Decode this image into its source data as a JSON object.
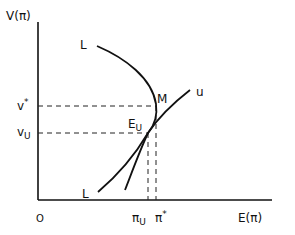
{
  "diagram": {
    "y_axis_label": "V(π)",
    "x_axis_label": "E(π)",
    "origin_label": "O",
    "y_ticks": [
      {
        "label": "v*",
        "main": "v",
        "sup": "*"
      },
      {
        "label": "vU",
        "main": "v",
        "sub": "U"
      }
    ],
    "x_ticks": [
      {
        "label": "πU",
        "main": "π",
        "sub": "U"
      },
      {
        "label": "π*",
        "main": "π",
        "sup": "*"
      }
    ],
    "curve_labels": {
      "L_upper": "L",
      "L_lower": "L",
      "u": "u"
    },
    "points": {
      "M": "M",
      "EU": {
        "main": "E",
        "sub": "U"
      }
    }
  }
}
